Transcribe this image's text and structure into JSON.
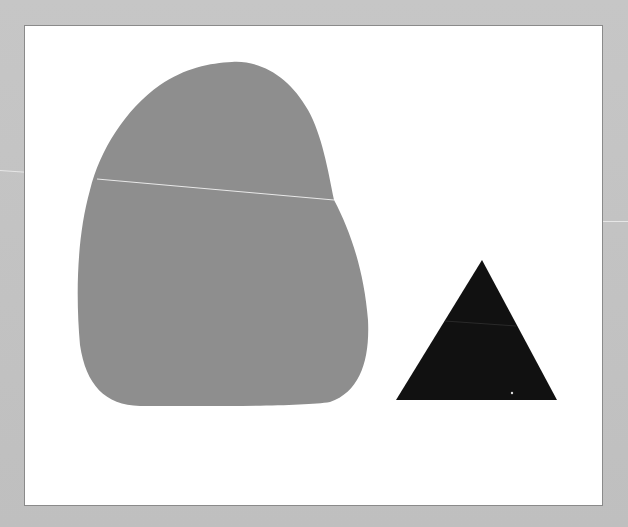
{
  "scene": {
    "description": "Grey rounded blob and black triangle on a white card over grey background",
    "colors": {
      "background": "#c2c2c2",
      "panel": "#ffffff",
      "panel_border": "#8a8a8a",
      "blob": "#8e8e8e",
      "triangle": "#111111",
      "scratch": "#e8e8e8"
    },
    "shapes": [
      {
        "name": "grey-blob",
        "type": "freeform"
      },
      {
        "name": "black-triangle",
        "type": "triangle",
        "points": [
          [
            482,
            260
          ],
          [
            396,
            400
          ],
          [
            557,
            400
          ]
        ]
      }
    ]
  }
}
